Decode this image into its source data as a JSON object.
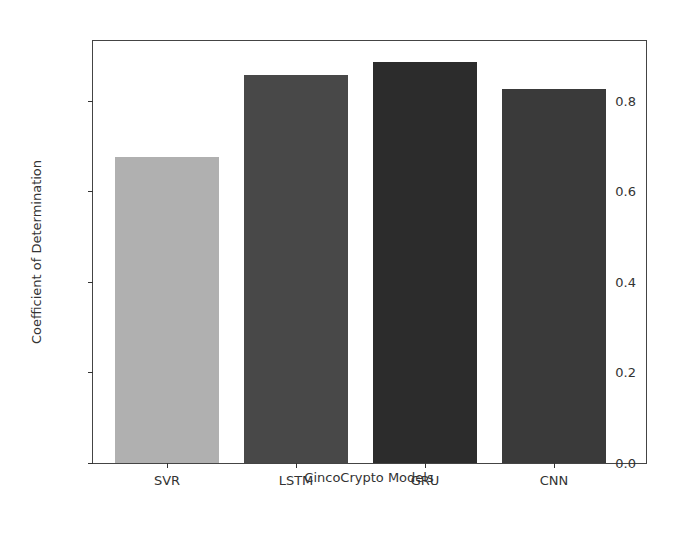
{
  "chart_data": {
    "type": "bar",
    "title": "",
    "xlabel": "CincoCrypto Models",
    "ylabel": "Coefficient of Determination",
    "categories": [
      "SVR",
      "LSTM",
      "GRU",
      "CNN"
    ],
    "values": [
      0.675,
      0.857,
      0.886,
      0.826
    ],
    "colors": [
      "#b0b0b0",
      "#484848",
      "#2c2c2c",
      "#3a3a3a"
    ],
    "ylim": [
      0.0,
      0.932
    ],
    "yticks": [
      0.0,
      0.2,
      0.4,
      0.6,
      0.8
    ],
    "ytick_labels": [
      "0.0",
      "0.2",
      "0.4",
      "0.6",
      "0.8"
    ],
    "grid": false,
    "legend": null
  }
}
